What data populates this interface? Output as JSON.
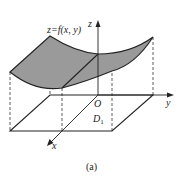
{
  "figure": {
    "surface_label": "z=f(x, y)",
    "axis_z": "z",
    "axis_y": "y",
    "axis_x": "x",
    "origin": "O",
    "region_label_main": "D",
    "region_label_sub": "1",
    "caption": "(a)",
    "colors": {
      "surface_fill": "#9a9a9a",
      "line": "#222222",
      "background": "#ffffff"
    }
  }
}
